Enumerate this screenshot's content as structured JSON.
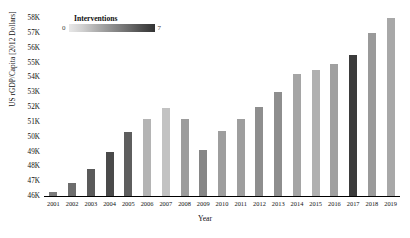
{
  "legend": {
    "title": "Interventions",
    "min": "0",
    "max": "7"
  },
  "axes": {
    "xlabel": "Year",
    "ylabel": "US rGDP/Capita [2012 Dollars]",
    "yticks": [
      "58K",
      "57K",
      "56K",
      "55K",
      "54K",
      "53K",
      "52K",
      "51K",
      "50K",
      "49K",
      "48K",
      "47K",
      "46K"
    ]
  },
  "chart_data": {
    "type": "bar",
    "title": "",
    "xlabel": "Year",
    "ylabel": "US rGDP/Capita [2012 Dollars]",
    "ylim": [
      46000,
      58000
    ],
    "ytick_values": [
      58000,
      57000,
      56000,
      55000,
      54000,
      53000,
      52000,
      51000,
      50000,
      49000,
      48000,
      47000,
      46000
    ],
    "grid": false,
    "legend": {
      "label": "Interventions",
      "type": "colorbar",
      "min": 0,
      "max": 7,
      "position": "top-left"
    },
    "categories": [
      "2001",
      "2002",
      "2003",
      "2004",
      "2005",
      "2006",
      "2007",
      "2008",
      "2009",
      "2010",
      "2011",
      "2012",
      "2013",
      "2014",
      "2015",
      "2016",
      "2017",
      "2018",
      "2019"
    ],
    "values": [
      46300,
      46900,
      47800,
      49000,
      50300,
      51200,
      51900,
      51200,
      49100,
      50400,
      51200,
      52000,
      53000,
      54200,
      54500,
      54900,
      55500,
      57000,
      58000
    ],
    "interventions": [
      4,
      5,
      6,
      7,
      6,
      2,
      1,
      3,
      4,
      4,
      4,
      4,
      4,
      3,
      2,
      3,
      7,
      3,
      2
    ],
    "bar_colors": [
      "#7b7b7b",
      "#6d6d6d",
      "#5a5a5a",
      "#4a4a4a",
      "#5e5e5e",
      "#b4b4b4",
      "#c2c2c2",
      "#9c9c9c",
      "#868686",
      "#9e9e9e",
      "#9e9e9e",
      "#8e8e8e",
      "#8e8e8e",
      "#a5a5a5",
      "#b0b0b0",
      "#a0a0a0",
      "#3b3b3b",
      "#9a9a9a",
      "#a8a8a8"
    ]
  }
}
